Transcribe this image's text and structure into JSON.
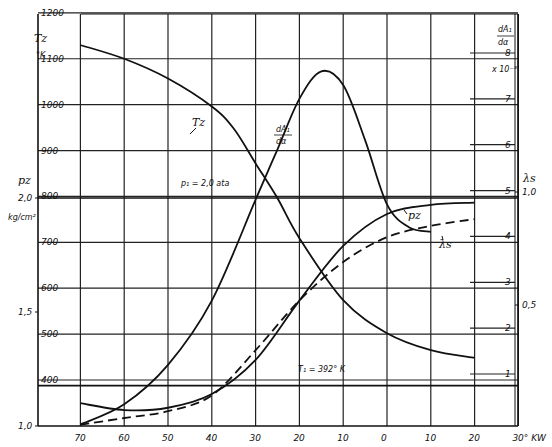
{
  "chart_data": {
    "type": "line",
    "title": "",
    "xlabel": "°KW",
    "x_ticks": [
      {
        "value": -70,
        "label": "70"
      },
      {
        "value": -60,
        "label": "60"
      },
      {
        "value": -50,
        "label": "50"
      },
      {
        "value": -40,
        "label": "40"
      },
      {
        "value": -30,
        "label": "30"
      },
      {
        "value": -20,
        "label": "20"
      },
      {
        "value": -10,
        "label": "10"
      },
      {
        "value": 0,
        "label": "0"
      },
      {
        "value": 10,
        "label": "10"
      },
      {
        "value": 20,
        "label": "20"
      },
      {
        "value": 30,
        "label": "30° KW"
      }
    ],
    "xlim": [
      -70,
      30
    ],
    "axes": {
      "left_T": {
        "label": "Tz",
        "unit": "°K",
        "ticks": [
          400,
          500,
          600,
          700,
          800,
          900,
          1000,
          1100,
          1200
        ],
        "range": [
          300,
          1200
        ]
      },
      "left_p": {
        "label": "pz",
        "unit": "kg/cm²",
        "ticks": [
          {
            "value": 1.0,
            "label": "1,0"
          },
          {
            "value": 1.5,
            "label": "1,5"
          },
          {
            "value": 2.0,
            "label": "2,0"
          }
        ],
        "range": [
          1.0,
          2.0
        ]
      },
      "right_dA": {
        "label_num": "dA₁",
        "label_den": "dα",
        "unit": "x 10⁻³",
        "ticks": [
          1,
          2,
          3,
          4,
          5,
          6,
          7,
          8
        ],
        "range": [
          -0.1,
          8.5
        ]
      },
      "right_lambda": {
        "label": "λs",
        "ticks": [
          {
            "value": 0.5,
            "label": "0,5"
          },
          {
            "value": 1.0,
            "label": "1,0"
          }
        ],
        "range": [
          0,
          1.0
        ]
      }
    },
    "grid": true,
    "series": [
      {
        "name": "Tz",
        "axis": "left_T",
        "style": "solid",
        "x": [
          -70,
          -60,
          -50,
          -40,
          -35,
          -30,
          -25,
          -20,
          -10,
          0,
          10,
          20
        ],
        "y": [
          1130,
          1100,
          1057,
          996,
          948,
          872,
          796,
          709,
          574,
          502,
          465,
          448
        ]
      },
      {
        "name": "dA1/dα",
        "axis": "right_dA",
        "style": "solid",
        "x": [
          -70,
          -60,
          -50,
          -40,
          -30,
          -25,
          -20,
          -15,
          -10,
          -5,
          0,
          5,
          10
        ],
        "y": [
          -0.1,
          0.34,
          1.2,
          2.6,
          4.8,
          5.9,
          7.0,
          7.6,
          7.3,
          6.1,
          4.7,
          4.2,
          4.1
        ]
      },
      {
        "name": "pz",
        "axis": "left_p",
        "style": "solid",
        "x": [
          -70,
          -60,
          -50,
          -40,
          -30,
          -20,
          -10,
          0,
          10,
          20
        ],
        "y": [
          1.1,
          1.07,
          1.08,
          1.14,
          1.29,
          1.55,
          1.79,
          1.93,
          1.97,
          1.98
        ]
      },
      {
        "name": "λs",
        "axis": "right_lambda",
        "style": "dashed",
        "x": [
          -70,
          -60,
          -50,
          -40,
          -30,
          -20,
          -10,
          0,
          10,
          20
        ],
        "y": [
          -0.03,
          0.0,
          0.03,
          0.1,
          0.3,
          0.52,
          0.69,
          0.8,
          0.85,
          0.88
        ]
      }
    ],
    "reference_lines": [
      {
        "axis": "left_p",
        "value": 2.0,
        "label": "p₁ = 2,0 ata"
      },
      {
        "axis": "left_T",
        "value": 392,
        "label": "T₁ = 392° K"
      }
    ],
    "annotations": [
      {
        "text": "Tz",
        "near_series": "Tz"
      },
      {
        "text": "dA₁/dα",
        "near_series": "dA1/dα"
      },
      {
        "text": "pz",
        "near_series": "pz"
      },
      {
        "text": "λs",
        "near_series": "λs"
      }
    ]
  }
}
